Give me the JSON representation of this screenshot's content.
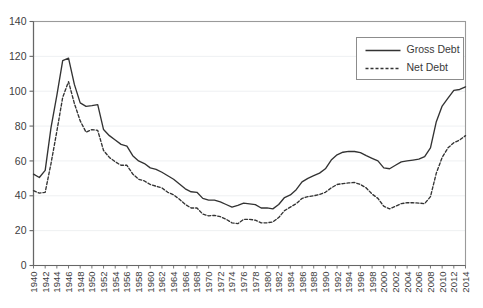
{
  "chart_data": {
    "type": "line",
    "title": "",
    "subtitle": "",
    "xlabel": "",
    "ylabel": "",
    "xlim": [
      1940,
      2014
    ],
    "ylim": [
      0,
      140
    ],
    "ytick_step": 20,
    "xtick_step": 2,
    "grid": true,
    "grid_axis": "y",
    "legend_position": "top-right",
    "yticks": [
      0,
      20,
      40,
      60,
      80,
      100,
      120,
      140
    ],
    "ytick_labels": [
      "0",
      "20",
      "40",
      "60",
      "80",
      "100",
      "120",
      "140"
    ],
    "categories": [
      1940,
      1941,
      1942,
      1943,
      1944,
      1945,
      1946,
      1947,
      1948,
      1949,
      1950,
      1951,
      1952,
      1953,
      1954,
      1955,
      1956,
      1957,
      1958,
      1959,
      1960,
      1961,
      1962,
      1963,
      1964,
      1965,
      1966,
      1967,
      1968,
      1969,
      1970,
      1971,
      1972,
      1973,
      1974,
      1975,
      1976,
      1977,
      1978,
      1979,
      1980,
      1981,
      1982,
      1983,
      1984,
      1985,
      1986,
      1987,
      1988,
      1989,
      1990,
      1991,
      1992,
      1993,
      1994,
      1995,
      1996,
      1997,
      1998,
      1999,
      2000,
      2001,
      2002,
      2003,
      2004,
      2005,
      2006,
      2007,
      2008,
      2009,
      2010,
      2011,
      2012,
      2013,
      2014
    ],
    "xtick_labels": [
      "1940",
      "1942",
      "1944",
      "1946",
      "1948",
      "1950",
      "1952",
      "1954",
      "1956",
      "1958",
      "1960",
      "1962",
      "1964",
      "1966",
      "1968",
      "1970",
      "1972",
      "1974",
      "1976",
      "1978",
      "1980",
      "1982",
      "1984",
      "1986",
      "1988",
      "1990",
      "1992",
      "1994",
      "1996",
      "1998",
      "2000",
      "2002",
      "2004",
      "2006",
      "2008",
      "2010",
      "2012",
      "2014"
    ],
    "series": [
      {
        "name": "Gross Debt",
        "style": "solid",
        "color": "#333333",
        "values": [
          52.4,
          50.5,
          54.6,
          79.1,
          97.6,
          117.5,
          119.0,
          103.9,
          93.3,
          91.3,
          91.7,
          92.3,
          78.0,
          74.5,
          72.0,
          69.5,
          68.5,
          63.0,
          60.0,
          58.5,
          56.0,
          55.2,
          53.5,
          51.5,
          49.5,
          46.8,
          44.0,
          42.3,
          42.0,
          38.5,
          37.5,
          37.5,
          36.5,
          35.0,
          33.5,
          34.5,
          35.8,
          35.4,
          34.9,
          33.0,
          33.1,
          32.5,
          35.0,
          39.0,
          40.5,
          43.5,
          48.0,
          50.0,
          51.5,
          53.0,
          55.5,
          60.5,
          63.5,
          65.0,
          65.5,
          65.4,
          64.8,
          63.0,
          61.5,
          60.0,
          56.0,
          55.5,
          57.5,
          59.5,
          60.0,
          60.5,
          61.0,
          62.5,
          67.5,
          82.5,
          91.5,
          96.0,
          100.5,
          101.0,
          102.5
        ]
      },
      {
        "name": "Net Debt",
        "style": "dashed",
        "color": "#333333",
        "values": [
          42.9,
          41.5,
          42.0,
          58.5,
          77.0,
          96.5,
          105.5,
          93.0,
          83.0,
          76.5,
          78.0,
          77.5,
          66.0,
          62.0,
          59.5,
          57.5,
          57.5,
          52.5,
          49.5,
          48.5,
          46.5,
          45.5,
          44.5,
          42.0,
          40.5,
          38.0,
          35.0,
          33.0,
          33.0,
          29.5,
          28.5,
          28.8,
          28.0,
          26.5,
          24.5,
          24.0,
          26.5,
          26.5,
          26.0,
          24.5,
          24.5,
          25.0,
          27.5,
          31.5,
          33.5,
          35.5,
          38.5,
          39.5,
          40.0,
          40.8,
          42.0,
          44.5,
          46.5,
          47.0,
          47.4,
          47.6,
          46.5,
          44.5,
          41.0,
          38.5,
          34.0,
          32.5,
          34.0,
          35.5,
          36.0,
          36.0,
          35.8,
          35.5,
          39.5,
          53.0,
          62.0,
          67.5,
          70.5,
          72.0,
          74.5
        ]
      }
    ]
  },
  "legend": {
    "entries": [
      {
        "label": "Gross Debt",
        "style": "solid"
      },
      {
        "label": "Net Debt",
        "style": "dashed"
      }
    ]
  }
}
